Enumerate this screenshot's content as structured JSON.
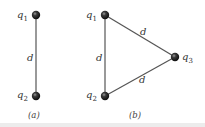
{
  "figure": {
    "panels": [
      {
        "caption": "(a)",
        "charges": [
          {
            "name": "q",
            "sub": "1"
          },
          {
            "name": "q",
            "sub": "2"
          }
        ],
        "separations": [
          "d"
        ]
      },
      {
        "caption": "(b)",
        "charges": [
          {
            "name": "q",
            "sub": "1"
          },
          {
            "name": "q",
            "sub": "2"
          },
          {
            "name": "q",
            "sub": "3"
          }
        ],
        "separations": [
          "d",
          "d",
          "d"
        ]
      }
    ],
    "colors": {
      "line": "#555555",
      "charge": "#1a1a1a",
      "text": "#333333"
    }
  }
}
